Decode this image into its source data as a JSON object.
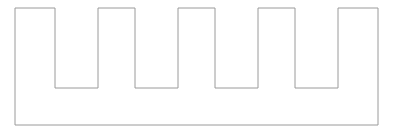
{
  "canvas": {
    "width": 393,
    "height": 135,
    "background_color": "#ffffff"
  },
  "figure": {
    "name": "comb-outline",
    "stroke_color": "#9a9a9a",
    "fill_color": "#ffffff",
    "stroke_width": 1,
    "geometry": {
      "left": 15,
      "right": 378,
      "top": 8,
      "bottom": 125,
      "notch_bottom": 88,
      "notch_depth": 80,
      "body_height": 117,
      "body_width": 363,
      "notch_count": 4,
      "tooth_count": 5,
      "notches": [
        {
          "index": 1,
          "x_start": 55,
          "x_end": 98,
          "width": 43
        },
        {
          "index": 2,
          "x_start": 135,
          "x_end": 178,
          "width": 43
        },
        {
          "index": 3,
          "x_start": 215,
          "x_end": 258,
          "width": 43
        },
        {
          "index": 4,
          "x_start": 295,
          "x_end": 338,
          "width": 43
        }
      ],
      "teeth": [
        {
          "index": 1,
          "x_start": 15,
          "x_end": 55,
          "width": 40
        },
        {
          "index": 2,
          "x_start": 98,
          "x_end": 135,
          "width": 37
        },
        {
          "index": 3,
          "x_start": 178,
          "x_end": 215,
          "width": 37
        },
        {
          "index": 4,
          "x_start": 258,
          "x_end": 295,
          "width": 37
        },
        {
          "index": 5,
          "x_start": 338,
          "x_end": 378,
          "width": 40
        }
      ]
    },
    "path": "M 15 8 L 55 8 L 55 88 L 98 88 L 98 8 L 135 8 L 135 88 L 178 88 L 178 8 L 215 8 L 215 88 L 258 88 L 258 8 L 295 8 L 295 88 L 338 88 L 338 8 L 378 8 L 378 125 L 15 125 Z"
  }
}
